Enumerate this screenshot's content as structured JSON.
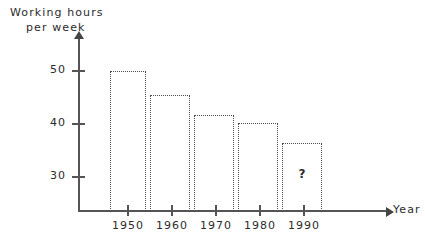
{
  "chart_data": {
    "type": "bar",
    "title": "",
    "ylabel": "Working hours per week",
    "ylabel_lines": [
      "Working hours",
      "per week"
    ],
    "xlabel": "Year",
    "categories": [
      "1950",
      "1960",
      "1970",
      "1980",
      "1990"
    ],
    "values": [
      50,
      45.5,
      41.7,
      40.2,
      36.4
    ],
    "value_labels": [
      "",
      "",
      "",
      "",
      "?"
    ],
    "bar_spans": [
      {
        "start": 1946,
        "end": 1954
      },
      {
        "start": 1955,
        "end": 1964
      },
      {
        "start": 1965,
        "end": 1974
      },
      {
        "start": 1975,
        "end": 1984
      },
      {
        "start": 1985,
        "end": 1994
      }
    ],
    "ytick_labels": [
      "50",
      "40",
      "30"
    ],
    "ytick_values": [
      50,
      40,
      30
    ],
    "xtick_labels": [
      "1950",
      "1960",
      "1970",
      "1980",
      "1990"
    ],
    "xtick_values": [
      1950,
      1960,
      1970,
      1980,
      1990
    ],
    "ylim": [
      24,
      54
    ],
    "xlim": [
      1943,
      2002
    ],
    "grid": false,
    "legend": null,
    "annotations": [
      {
        "text": "?",
        "x": 1990,
        "y": 31,
        "series_index": 4
      }
    ],
    "bar_style": "dotted-outline",
    "colors": {
      "axis": "#555555",
      "bar_outline": "#4a4a4a",
      "text": "#2b2b2b",
      "background": "#ffffff"
    }
  },
  "axes": {
    "y_title_line1": "Working hours",
    "y_title_line2": "per week",
    "x_title": "Year"
  }
}
